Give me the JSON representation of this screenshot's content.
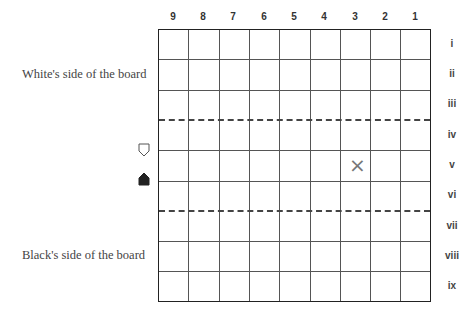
{
  "board": {
    "columns": [
      "9",
      "8",
      "7",
      "6",
      "5",
      "4",
      "3",
      "2",
      "1"
    ],
    "rows": [
      "i",
      "ii",
      "iii",
      "iv",
      "v",
      "vi",
      "vii",
      "viii",
      "ix"
    ],
    "promotion_zone_dividers_after_rows": [
      "iii",
      "vi"
    ],
    "marked_square": {
      "file": "3",
      "rank": "v",
      "symbol": "×"
    }
  },
  "labels": {
    "white_side": "White's side of the board",
    "black_side": "Black's side of the board"
  },
  "pieces": {
    "white_piece": {
      "icon": "white-shogi-piece-icon",
      "row": "iv-v"
    },
    "black_piece": {
      "icon": "black-shogi-piece-icon",
      "row": "v-vi"
    }
  }
}
